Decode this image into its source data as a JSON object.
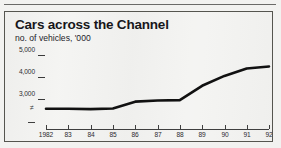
{
  "chart_data": {
    "type": "line",
    "title": "Cars across the Channel",
    "subtitle": "no. of vehicles, '000",
    "xlabel": "",
    "ylabel": "no. of vehicles, '000",
    "categories": [
      "1982",
      "83",
      "84",
      "85",
      "86",
      "87",
      "88",
      "89",
      "90",
      "91",
      "92"
    ],
    "x_tick_labels": [
      "1982",
      "83",
      "84",
      "85",
      "86",
      "87",
      "88",
      "89",
      "90",
      "91",
      "92"
    ],
    "y_tick_labels": [
      "5,000",
      "4,000",
      "3,000"
    ],
    "y_tick_values": [
      5000,
      4000,
      3000
    ],
    "y_axis_break_symbol": "≠",
    "ylim": [
      2400,
      5200
    ],
    "grid": false,
    "legend": null,
    "series": [
      {
        "name": "Cars across the Channel",
        "values": [
          2560,
          2560,
          2540,
          2570,
          2880,
          2930,
          2950,
          3600,
          4050,
          4390,
          4480
        ]
      }
    ],
    "line_color": "#111111",
    "line_width": 2.6
  },
  "page": {
    "background_color": "#f2f2f0",
    "frame_color": "#55554f",
    "text_color": "#17171a"
  }
}
